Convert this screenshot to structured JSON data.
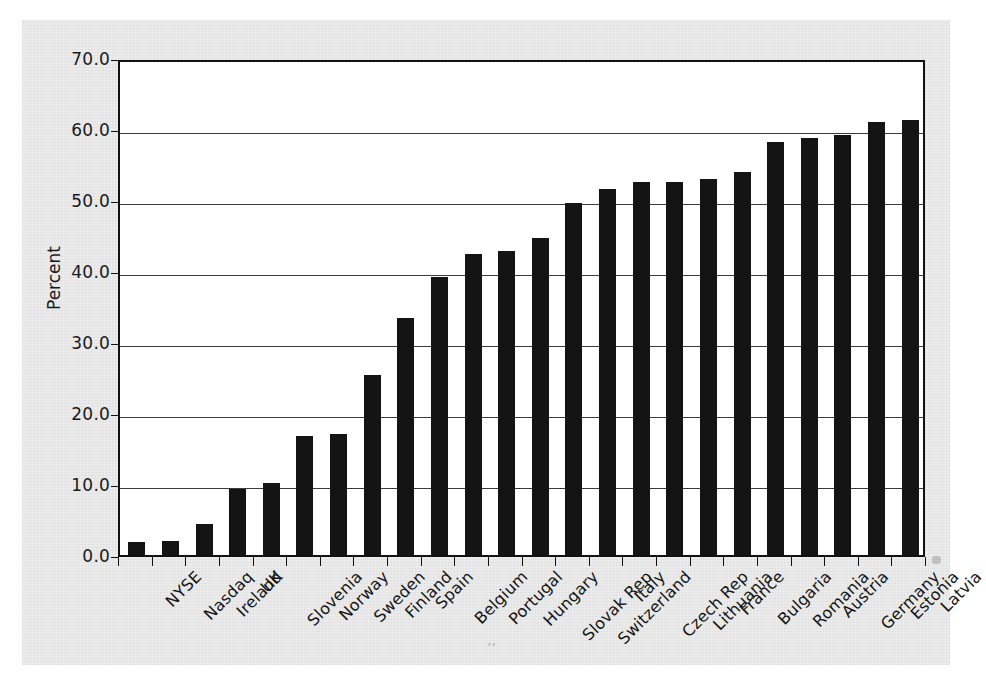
{
  "chart_data": {
    "type": "bar",
    "title": "",
    "xlabel": "",
    "ylabel": "Percent",
    "ylim": [
      0.0,
      70.0
    ],
    "ytick_step": 10.0,
    "ytick_labels": [
      "0.0",
      "10.0",
      "20.0",
      "30.0",
      "40.0",
      "50.0",
      "60.0",
      "70.0"
    ],
    "ytick_values": [
      0.0,
      10.0,
      20.0,
      30.0,
      40.0,
      50.0,
      60.0,
      70.0
    ],
    "grid": "horizontal",
    "legend": "none",
    "bar_color": "#141414",
    "plot_background": "#ffffff",
    "figure_background": "#ececec",
    "categories": [
      "NYSE",
      "Nasdaq",
      "Ireland",
      "UK",
      "Slovenia",
      "Norway",
      "Sweden",
      "Finland",
      "Spain",
      "Belgium",
      "Portugal",
      "Hungary",
      "Slovak Rep",
      "Switzerland",
      "Italy",
      "Czech Rep",
      "Lithuania",
      "France",
      "Bulgaria",
      "Romania",
      "Austria",
      "Germany",
      "Estonia",
      "Latvia"
    ],
    "values": [
      1.8,
      2.0,
      4.3,
      9.3,
      10.2,
      16.7,
      17.1,
      25.3,
      33.4,
      39.2,
      42.4,
      42.8,
      44.6,
      49.6,
      51.5,
      52.6,
      52.6,
      53.0,
      53.9,
      58.2,
      58.8,
      59.1,
      61.0,
      61.2
    ]
  }
}
